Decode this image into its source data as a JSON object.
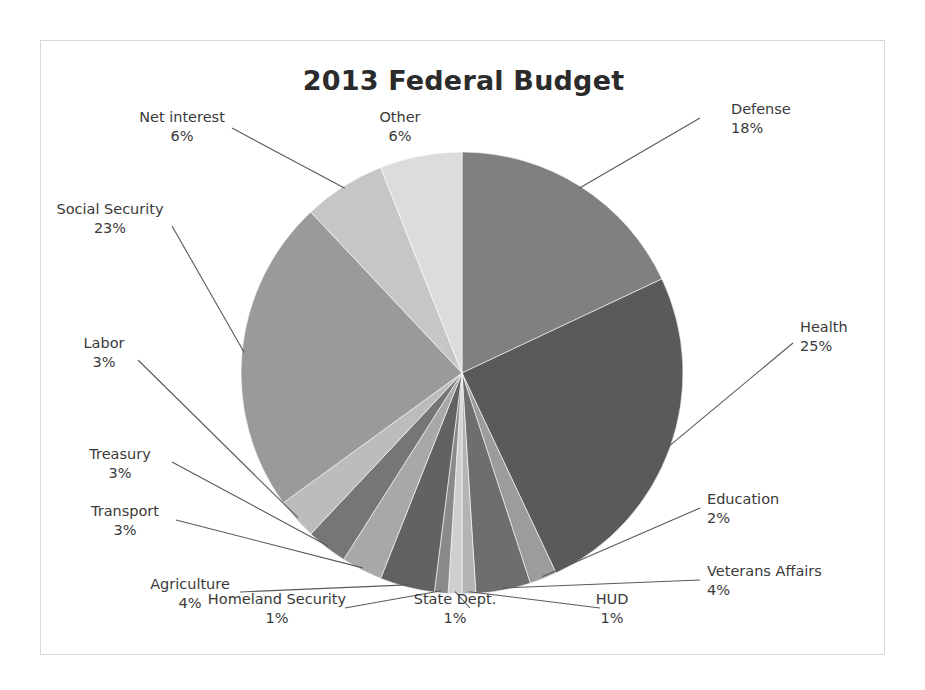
{
  "chart": {
    "title": "2013 Federal Budget",
    "frame_border_color": "#d8d8d8",
    "background_color": "#ffffff",
    "label_color": "#3a3a3a",
    "leader_line_color": "#595959"
  },
  "chart_data": {
    "type": "pie",
    "title": "2013 Federal Budget",
    "xlabel": "",
    "ylabel": "",
    "legend": "none",
    "grid": false,
    "start_angle_deg": 0,
    "direction": "clockwise",
    "value_unit": "percent",
    "total": 100,
    "categories": [
      "Defense",
      "Health",
      "Education",
      "Veterans Affairs",
      "HUD",
      "State Dept.",
      "Homeland Security",
      "Agriculture",
      "Transport",
      "Treasury",
      "Labor",
      "Social Security",
      "Net interest",
      "Other"
    ],
    "values": [
      18,
      25,
      2,
      4,
      1,
      1,
      1,
      4,
      3,
      3,
      3,
      23,
      6,
      6
    ],
    "labels_formatted": [
      "18%",
      "25%",
      "2%",
      "4%",
      "1%",
      "1%",
      "1%",
      "4%",
      "3%",
      "3%",
      "3%",
      "23%",
      "6%",
      "6%"
    ],
    "colors": [
      "#808080",
      "#5a5a5a",
      "#9c9c9c",
      "#6e6e6e",
      "#b4b4b4",
      "#cfcfcf",
      "#8a8a8a",
      "#626262",
      "#a8a8a8",
      "#767676",
      "#bcbcbc",
      "#9a9a9a",
      "#c6c6c6",
      "#dcdcdc"
    ]
  },
  "slices": [
    {
      "name": "Defense",
      "pct": "18%",
      "label_align": "left"
    },
    {
      "name": "Health",
      "pct": "25%",
      "label_align": "left"
    },
    {
      "name": "Education",
      "pct": "2%",
      "label_align": "left"
    },
    {
      "name": "Veterans Affairs",
      "pct": "4%",
      "label_align": "left"
    },
    {
      "name": "HUD",
      "pct": "1%",
      "label_align": "center"
    },
    {
      "name": "State Dept.",
      "pct": "1%",
      "label_align": "center"
    },
    {
      "name": "Homeland Security",
      "pct": "1%",
      "label_align": "center"
    },
    {
      "name": "Agriculture",
      "pct": "4%",
      "label_align": "right"
    },
    {
      "name": "Transport",
      "pct": "3%",
      "label_align": "right"
    },
    {
      "name": "Treasury",
      "pct": "3%",
      "label_align": "right"
    },
    {
      "name": "Labor",
      "pct": "3%",
      "label_align": "right"
    },
    {
      "name": "Social Security",
      "pct": "23%",
      "label_align": "right"
    },
    {
      "name": "Net interest",
      "pct": "6%",
      "label_align": "right"
    },
    {
      "name": "Other",
      "pct": "6%",
      "label_align": "center"
    }
  ]
}
